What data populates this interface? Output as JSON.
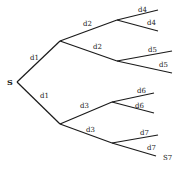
{
  "diagram": {
    "type": "tree",
    "root": {
      "label": "S"
    },
    "edges": [
      {
        "id": "e1",
        "label": "d1"
      },
      {
        "id": "e2",
        "label": "d1"
      },
      {
        "id": "e3",
        "label": "d2"
      },
      {
        "id": "e4",
        "label": "d2"
      },
      {
        "id": "e5",
        "label": "d3"
      },
      {
        "id": "e6",
        "label": "d3"
      },
      {
        "id": "e7",
        "label": "d4"
      },
      {
        "id": "e8",
        "label": "d4"
      },
      {
        "id": "e9",
        "label": "d5"
      },
      {
        "id": "e10",
        "label": "d5"
      },
      {
        "id": "e11",
        "label": "d6"
      },
      {
        "id": "e12",
        "label": "d6"
      },
      {
        "id": "e13",
        "label": "d7"
      },
      {
        "id": "e14",
        "label": "d7"
      }
    ],
    "terminal": {
      "label": "S7"
    }
  }
}
